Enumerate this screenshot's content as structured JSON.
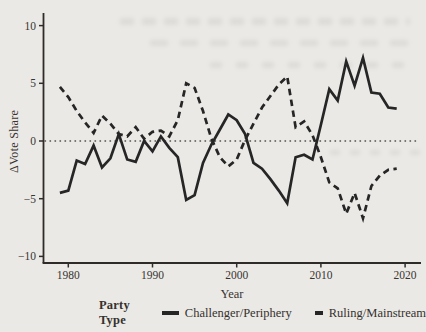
{
  "chart_data": {
    "type": "line",
    "title": "",
    "xlabel": "Year",
    "ylabel": "ΔVote Share",
    "legend_title": "Party Type",
    "legend_position": "bottom",
    "grid": false,
    "reference_line_y": 0,
    "xticks": [
      1980,
      1990,
      2000,
      2010,
      2020
    ],
    "yticks": [
      -10,
      -5,
      0,
      5,
      10
    ],
    "xlim": [
      1977,
      2022
    ],
    "ylim": [
      -11,
      11
    ],
    "x": [
      1979,
      1980,
      1981,
      1982,
      1983,
      1984,
      1985,
      1986,
      1987,
      1988,
      1989,
      1990,
      1991,
      1992,
      1993,
      1994,
      1995,
      1996,
      1997,
      1998,
      1999,
      2000,
      2001,
      2002,
      2003,
      2004,
      2005,
      2006,
      2007,
      2008,
      2009,
      2010,
      2011,
      2012,
      2013,
      2014,
      2015,
      2016,
      2017,
      2018,
      2019
    ],
    "series": [
      {
        "name": "Challenger/Periphery",
        "style": "solid",
        "values": [
          -4.5,
          -4.3,
          -1.7,
          -2.0,
          -0.4,
          -2.3,
          -1.5,
          0.6,
          -1.6,
          -1.8,
          0.0,
          -0.9,
          0.4,
          -0.6,
          -1.4,
          -5.1,
          -4.7,
          -1.9,
          -0.3,
          1.0,
          2.3,
          1.8,
          0.6,
          -1.9,
          -2.4,
          -3.3,
          -4.3,
          -5.4,
          -1.4,
          -1.2,
          -1.6,
          1.4,
          4.5,
          3.5,
          6.9,
          4.8,
          7.2,
          4.2,
          4.1,
          2.9,
          2.8
        ]
      },
      {
        "name": "Ruling/Mainstream",
        "style": "dashed",
        "values": [
          4.7,
          3.8,
          2.6,
          1.6,
          0.7,
          2.2,
          1.5,
          0.6,
          0.4,
          1.2,
          0.2,
          0.8,
          0.9,
          0.4,
          1.8,
          5.0,
          4.6,
          2.6,
          0.2,
          -1.4,
          -2.2,
          -1.6,
          0.1,
          1.5,
          2.9,
          3.9,
          4.9,
          5.6,
          1.2,
          1.7,
          0.5,
          -1.4,
          -3.6,
          -4.1,
          -6.3,
          -4.5,
          -6.7,
          -3.9,
          -3.0,
          -2.5,
          -2.4
        ]
      }
    ]
  },
  "colors": {
    "paper": "#ebe9e6",
    "ink": "#262626",
    "axis": "#2e2b28",
    "text": "#38342f",
    "dotted_zero_line": "#555250"
  }
}
